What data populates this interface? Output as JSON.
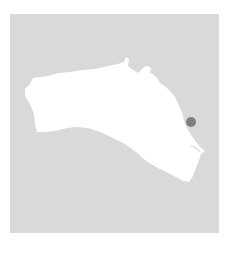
{
  "map": {
    "region": "Menorca",
    "colors": {
      "sea": "#d9d9d9",
      "land": "#ffffff",
      "marker": "#7f7f7f",
      "background": "#ffffff"
    },
    "marker": {
      "cx": 191,
      "cy": 122,
      "r": 5
    }
  }
}
